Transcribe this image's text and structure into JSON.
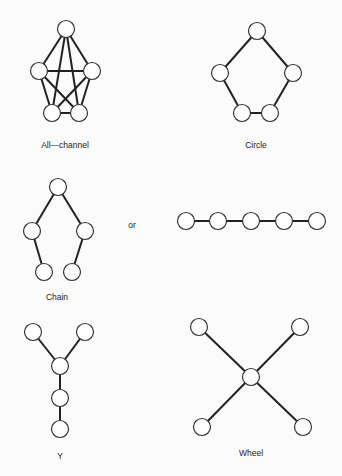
{
  "labels": {
    "all_channel": "All—channel",
    "circle": "Circle",
    "chain": "Chain",
    "or": "or",
    "y": "Y",
    "wheel": "Wheel"
  },
  "networks": [
    {
      "name": "All-channel",
      "nodes": 5,
      "edges": "all pairs (10)"
    },
    {
      "name": "Circle",
      "nodes": 5,
      "edges": 5
    },
    {
      "name": "Chain",
      "nodes": 5,
      "edges": 4,
      "alternate_form": "horizontal line of 5 nodes"
    },
    {
      "name": "Y",
      "nodes": 5,
      "edges": 4
    },
    {
      "name": "Wheel",
      "nodes": 5,
      "edges": 4
    }
  ]
}
